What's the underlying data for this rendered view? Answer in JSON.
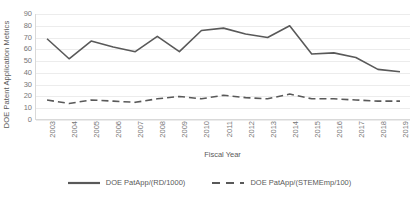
{
  "chart_data": {
    "type": "line",
    "title": "",
    "xlabel": "Fiscal Year",
    "ylabel": "DOE Patent Application Metrics",
    "categories": [
      "2003",
      "2004",
      "2005",
      "2006",
      "2007",
      "2008",
      "2009",
      "2010",
      "2011",
      "2012",
      "2013",
      "2014",
      "2015",
      "2016",
      "2017",
      "2018",
      "2019"
    ],
    "ylim": [
      0,
      90
    ],
    "ytick_labels": [
      "0",
      "10",
      "20",
      "30",
      "40",
      "50",
      "60",
      "70",
      "80",
      "90"
    ],
    "ytick_values": [
      0,
      10,
      20,
      30,
      40,
      50,
      60,
      70,
      80,
      90
    ],
    "grid": true,
    "legend_position": "bottom",
    "series": [
      {
        "name": "DOE PatApp/(RD/1000)",
        "style": "solid",
        "color": "#595959",
        "values": [
          69,
          52,
          67,
          62,
          58,
          71,
          58,
          76,
          78,
          73,
          70,
          80,
          56,
          57,
          53,
          43,
          41
        ]
      },
      {
        "name": "DOE PatApp/(STEMEmp/100)",
        "style": "dashed",
        "color": "#595959",
        "values": [
          17,
          14,
          17,
          16,
          15,
          18,
          20,
          18,
          21,
          19,
          18,
          22,
          18,
          18,
          17,
          16,
          16
        ]
      }
    ]
  },
  "axes": {
    "y_title": "DOE Patent Application Metrics",
    "x_title": "Fiscal Year"
  },
  "legend": {
    "items": [
      {
        "label": "DOE PatApp/(RD/1000)",
        "style": "solid"
      },
      {
        "label": "DOE PatApp/(STEMEmp/100)",
        "style": "dashed"
      }
    ]
  },
  "colors": {
    "series_line": "#595959",
    "gridline": "#ececec",
    "axis_line": "#d9d9d9",
    "tick_text": "#767676",
    "title_text": "#595959",
    "background": "#ffffff"
  }
}
